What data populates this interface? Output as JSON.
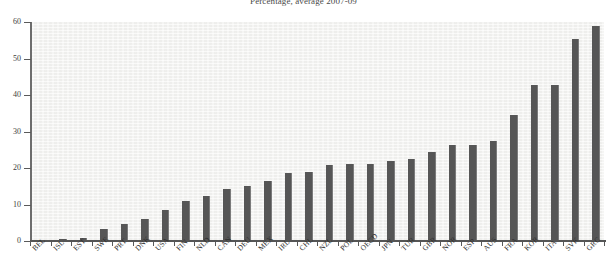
{
  "chart_data": {
    "type": "bar",
    "title": "Percentage, average 2007-09",
    "xlabel": "",
    "ylabel": "",
    "ylim": [
      0,
      60
    ],
    "yticks": [
      0,
      10,
      20,
      30,
      40,
      50,
      60
    ],
    "grid": false,
    "legend": null,
    "bar_color": "#565656",
    "plot_background": "#f4f4f2",
    "categories": [
      "BEL",
      "ISL",
      "EST",
      "SWE",
      "PRT",
      "DNK",
      "USA",
      "FIN",
      "NLD",
      "CAN",
      "DEU",
      "MEX",
      "IRL",
      "CHL",
      "NZL",
      "POL",
      "OECD",
      "JPN",
      "TUR",
      "GBR",
      "NOR",
      "ESP",
      "AUS",
      "FRA",
      "KOR",
      "ITA",
      "SVK",
      "GRC"
    ],
    "values": [
      0.3,
      0.5,
      0.9,
      3.4,
      4.6,
      6.1,
      8.5,
      11.0,
      12.4,
      14.2,
      15.2,
      16.5,
      18.6,
      19.0,
      20.7,
      21.0,
      21.2,
      21.9,
      22.4,
      24.3,
      26.2,
      26.4,
      27.4,
      34.5,
      42.8,
      42.8,
      55.4,
      58.9
    ]
  }
}
